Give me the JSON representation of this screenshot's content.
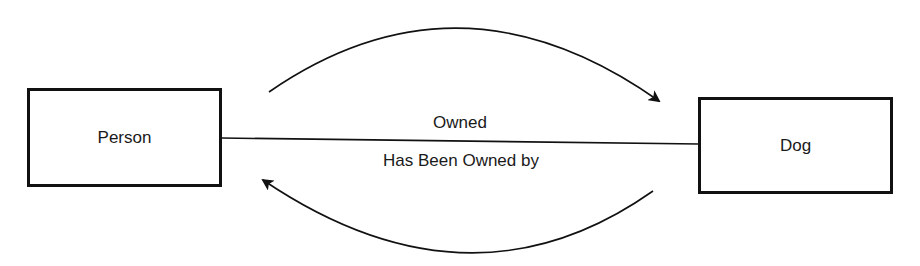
{
  "diagram": {
    "type": "entity-relationship",
    "entities": [
      {
        "id": "person",
        "label": "Person"
      },
      {
        "id": "dog",
        "label": "Dog"
      }
    ],
    "relationship": {
      "from": "person",
      "to": "dog",
      "forward_label": "Owned",
      "reverse_label": "Has Been Owned by"
    },
    "arrows": [
      {
        "id": "forward-arrow",
        "direction": "person-to-dog",
        "position": "above"
      },
      {
        "id": "reverse-arrow",
        "direction": "dog-to-person",
        "position": "below"
      }
    ],
    "colors": {
      "stroke": "#111111",
      "background": "#ffffff",
      "text": "#1a1a1a"
    }
  }
}
